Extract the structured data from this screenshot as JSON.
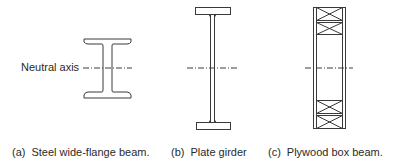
{
  "labels": {
    "neutral_axis": "Neutral axis"
  },
  "captions": [
    {
      "tag": "(a)",
      "text": "Steel wide-flange beam."
    },
    {
      "tag": "(b)",
      "text": "Plate girder"
    },
    {
      "tag": "(c)",
      "text": "Plywood box beam."
    }
  ],
  "colors": {
    "stroke": "#3a3a3a",
    "background": "#ffffff"
  }
}
